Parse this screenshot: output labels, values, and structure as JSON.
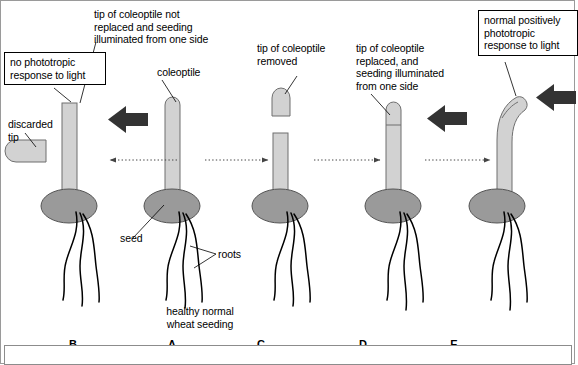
{
  "diagram": {
    "title_text": "wheat coleoptile phototropism experiment",
    "colors": {
      "coleoptile_fill": "#d2d2d2",
      "coleoptile_stroke": "#6f6f6f",
      "seed_fill": "#9a9a9a",
      "seed_stroke": "#555555",
      "root_stroke": "#000000",
      "light_arrow": "#333333",
      "dotted_arrow": "#444444",
      "frame": "#8c8c8c",
      "text": "#000000"
    },
    "annotations": [
      {
        "id": "no-phototropic-response",
        "text": "no phototropic\nresponse to light",
        "boxed": true
      },
      {
        "id": "tip-not-replaced",
        "text": "tip of coleoptile not\nreplaced and seeding\nilluminated from one side",
        "boxed": false
      },
      {
        "id": "coleoptile",
        "text": "coleoptile",
        "boxed": false
      },
      {
        "id": "discarded-tip",
        "text": "discarded\ntip",
        "boxed": false
      },
      {
        "id": "tip-removed",
        "text": "tip of coleoptile\nremoved",
        "boxed": false
      },
      {
        "id": "tip-replaced",
        "text": "tip of coleoptile\nreplaced, and\nseeding illuminated\nfrom one side",
        "boxed": false
      },
      {
        "id": "normal-positive",
        "text": "normal positively\nphototropic\nresponse to light",
        "boxed": true
      },
      {
        "id": "seed",
        "text": "seed",
        "boxed": false
      },
      {
        "id": "roots",
        "text": "roots",
        "boxed": false
      },
      {
        "id": "healthy-normal",
        "text": "healthy normal\nwheat seeding",
        "boxed": false
      }
    ],
    "panels": [
      {
        "letter": "B",
        "x": 73,
        "state": "tip removed, illuminated one side, no bending"
      },
      {
        "letter": "A",
        "x": 172,
        "state": "intact control seedling"
      },
      {
        "letter": "C",
        "x": 261,
        "state": "tip removed, no light"
      },
      {
        "letter": "D",
        "x": 363,
        "state": "tip replaced, illuminated one side"
      },
      {
        "letter": "E",
        "x": 454,
        "state": "bends toward light"
      }
    ],
    "light_arrows": [
      {
        "panel": "B",
        "direction": "left"
      },
      {
        "panel": "D",
        "direction": "left"
      },
      {
        "panel": "E",
        "direction": "left"
      }
    ],
    "flow_arrows": [
      {
        "from": "A",
        "to": "B",
        "direction": "left",
        "style": "dotted"
      },
      {
        "from": "A",
        "to": "C",
        "direction": "right",
        "style": "dotted"
      },
      {
        "from": "C",
        "to": "D",
        "direction": "right",
        "style": "dotted"
      },
      {
        "from": "D",
        "to": "E",
        "direction": "right",
        "style": "dotted"
      }
    ]
  }
}
